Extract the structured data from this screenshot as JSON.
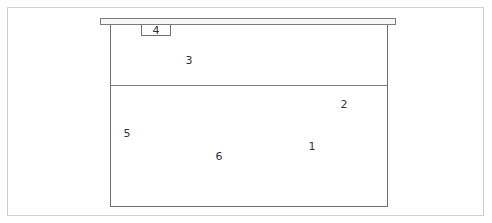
{
  "diagram": {
    "labels": [
      {
        "id": "1",
        "text": "1",
        "x": 312,
        "y": 146
      },
      {
        "id": "2",
        "text": "2",
        "x": 344,
        "y": 104
      },
      {
        "id": "3",
        "text": "3",
        "x": 189,
        "y": 60
      },
      {
        "id": "4",
        "text": "4",
        "x": 156,
        "y": 30
      },
      {
        "id": "5",
        "text": "5",
        "x": 127,
        "y": 133
      },
      {
        "id": "6",
        "text": "6",
        "x": 219,
        "y": 156
      }
    ]
  }
}
